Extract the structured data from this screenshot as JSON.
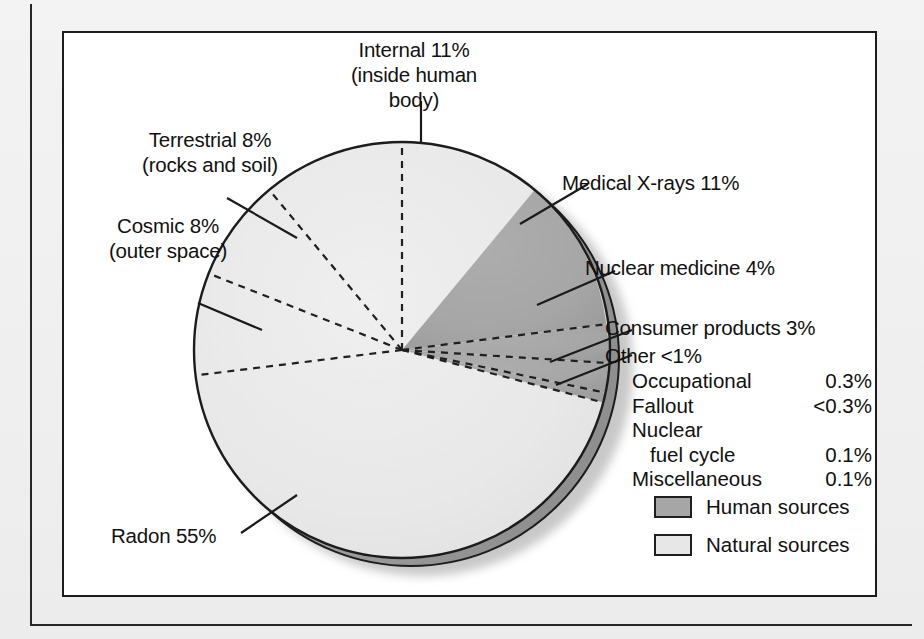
{
  "figure": {
    "labels": {
      "internal": "Internal 11%\n(inside human\nbody)",
      "terrestrial": "Terrestrial 8%\n(rocks and soil)",
      "cosmic": "Cosmic 8%\n(outer space)",
      "medical_xrays": "Medical X-rays 11%",
      "nuclear_medicine": "Nuclear medicine 4%",
      "consumer_products": "Consumer products 3%",
      "other": "Other <1%",
      "radon": "Radon 55%"
    },
    "other_breakdown": {
      "rows": [
        {
          "name": "Occupational",
          "value": "0.3%",
          "indent": false
        },
        {
          "name": "Fallout",
          "value": "<0.3%",
          "indent": false
        },
        {
          "name": "Nuclear",
          "value": "",
          "indent": false
        },
        {
          "name": "fuel cycle",
          "value": "0.1%",
          "indent": true
        },
        {
          "name": "Miscellaneous",
          "value": "0.1%",
          "indent": false
        }
      ]
    },
    "legend": {
      "items": [
        {
          "label": "Human sources",
          "swatch": "#a6a6a6"
        },
        {
          "label": "Natural sources",
          "swatch": "#e7e7e7"
        }
      ]
    },
    "colors": {
      "human": "#a6a6a6",
      "natural": "#e7e7e7",
      "outline": "#1c1c1c",
      "shadow_edge": "#9a9a9a",
      "shadow_soft": "#c9c9c9",
      "text": "#111111",
      "frame": "#1c1c1c",
      "page": "#f1f1f1"
    }
  },
  "chart_data": {
    "type": "pie",
    "title": "",
    "units": "percent of total radiation exposure",
    "legend_position": "bottom-right",
    "start_angle_deg": 0,
    "direction": "clockwise",
    "categories": [
      "Internal (inside human body)",
      "Medical X-rays",
      "Nuclear medicine",
      "Consumer products",
      "Other",
      "Radon",
      "Cosmic (outer space)",
      "Terrestrial (rocks and soil)"
    ],
    "values": [
      11,
      11,
      4,
      3,
      1,
      55,
      8,
      8
    ],
    "labels": [
      "Internal 11%",
      "Medical X-rays 11%",
      "Nuclear medicine 4%",
      "Consumer products 3%",
      "Other <1%",
      "Radon 55%",
      "Cosmic 8%",
      "Terrestrial 8%"
    ],
    "groups": [
      "Natural sources",
      "Human sources",
      "Human sources",
      "Human sources",
      "Human sources",
      "Natural sources",
      "Natural sources",
      "Natural sources"
    ],
    "group_totals": {
      "Natural sources": 82,
      "Human sources": 19
    },
    "sub_breakdown": {
      "parent": "Other <1%",
      "categories": [
        "Occupational",
        "Fallout",
        "Nuclear fuel cycle",
        "Miscellaneous"
      ],
      "values": [
        0.3,
        0.3,
        0.1,
        0.1
      ],
      "value_labels": [
        "0.3%",
        "<0.3%",
        "0.1%",
        "0.1%"
      ]
    }
  }
}
